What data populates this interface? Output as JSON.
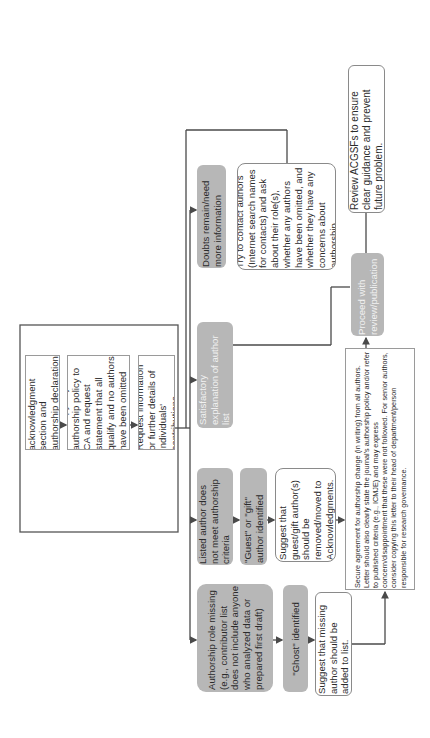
{
  "diagram": {
    "type": "flowchart",
    "orientation": "rotated-90-ccw",
    "colors": {
      "line": "#4a4a4a",
      "gray_box": "#b7b7b7",
      "border": "#8a8a8a"
    },
    "initial_steps": [
      "Review acknowledgment section and authorship declaration (if supplied) and/or:",
      "Send copy of journal authorship policy to CA and request statement that all qualify and no authors have been omitted and/or:",
      "Request information or further details of individuals' contributions."
    ],
    "outcomes": {
      "satisfactory": "Satisfactory explanation of author list",
      "doubts": "Doubts remain/need more information",
      "listed_not_meet": "Listed author does not meet authorship criteria",
      "role_missing": "Authorship role missing (e.g., contributor list does not include anyone who analyzed data or prepared first draft)"
    },
    "doubts_action": "Try to contact authors (Internet search names for contacts) and ask about their role(s), whether any authors have been omitted, and whether they have any concerns about authorship.",
    "guest_identified": "\"Guest\" or \"gift\" author identified",
    "guest_action": "Suggest that guest/gift author(s) should be removed/moved to Acknowledgments.",
    "ghost_identified": "\"Ghost\" identified",
    "ghost_action": "Suggest that missing author should be added to list.",
    "secure_agreement": "Secure agreement for authorship change (in writing) from all authors. Letter should also clearly state the journal's authorship policy and/or refer to published criteria (e.g., ICMJE) and may express concern/disappointment that these were not followed. For senior authors, consider copying this letter to their head of department/person responsible for research governance.",
    "proceed": "Proceed with review/publication",
    "review_acgsfs": "Review ACGSFs to ensure clear guidance and prevent future problem."
  }
}
